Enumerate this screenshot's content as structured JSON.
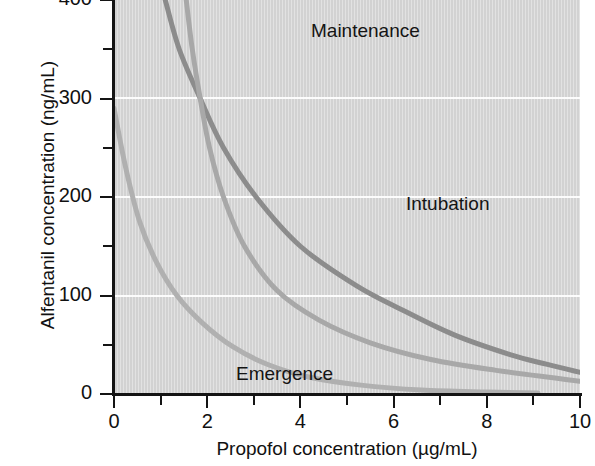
{
  "chart_data": {
    "type": "line",
    "title": "",
    "subtitle": "",
    "xlabel": "Propofol concentration (µg/mL)",
    "ylabel": "Alfentanil concentration (ng/mL)",
    "xlim": [
      0,
      10
    ],
    "ylim": [
      0,
      400
    ],
    "xticks": [
      0,
      1,
      2,
      3,
      4,
      5,
      6,
      7,
      8,
      9,
      10
    ],
    "xticklabels": [
      "0",
      "",
      "2",
      "",
      "4",
      "",
      "6",
      "",
      "8",
      "",
      "10"
    ],
    "yticks": [
      0,
      50,
      100,
      150,
      200,
      250,
      300,
      350,
      400
    ],
    "yticklabels": [
      "0",
      "",
      "100",
      "",
      "200",
      "",
      "300",
      "",
      "400"
    ],
    "grid": "horizontal-white-gridlines-at-100-200-300",
    "legend": "inline-curve-labels",
    "plot_background_color": "#d6d6d6",
    "series": [
      {
        "name": "Intubation",
        "label_position": {
          "x": 4.0,
          "y": 210
        },
        "color": "#8c8c8c",
        "linewidth": 5,
        "points": [
          {
            "x": 1.1,
            "y": 400
          },
          {
            "x": 1.4,
            "y": 350
          },
          {
            "x": 1.85,
            "y": 300
          },
          {
            "x": 2.35,
            "y": 250
          },
          {
            "x": 3.05,
            "y": 200
          },
          {
            "x": 4.0,
            "y": 150
          },
          {
            "x": 5.2,
            "y": 110
          },
          {
            "x": 6.2,
            "y": 85
          },
          {
            "x": 7.3,
            "y": 60
          },
          {
            "x": 8.5,
            "y": 40
          },
          {
            "x": 9.3,
            "y": 30
          },
          {
            "x": 10.0,
            "y": 22
          }
        ]
      },
      {
        "name": "Maintenance",
        "label_position": {
          "x": 1.8,
          "y": 375
        },
        "color": "#a8a8a8",
        "linewidth": 5,
        "points": [
          {
            "x": 1.55,
            "y": 400
          },
          {
            "x": 1.68,
            "y": 350
          },
          {
            "x": 1.85,
            "y": 300
          },
          {
            "x": 2.05,
            "y": 250
          },
          {
            "x": 2.35,
            "y": 200
          },
          {
            "x": 2.8,
            "y": 150
          },
          {
            "x": 3.5,
            "y": 105
          },
          {
            "x": 4.4,
            "y": 75
          },
          {
            "x": 5.5,
            "y": 52
          },
          {
            "x": 6.8,
            "y": 35
          },
          {
            "x": 8.2,
            "y": 24
          },
          {
            "x": 10.0,
            "y": 13
          }
        ]
      },
      {
        "name": "Emergence",
        "label_position": {
          "x": 0.2,
          "y": 35
        },
        "color": "#b0b0b0",
        "linewidth": 5,
        "points": [
          {
            "x": 0.0,
            "y": 290
          },
          {
            "x": 0.25,
            "y": 230
          },
          {
            "x": 0.55,
            "y": 175
          },
          {
            "x": 0.9,
            "y": 135
          },
          {
            "x": 1.35,
            "y": 100
          },
          {
            "x": 1.9,
            "y": 72
          },
          {
            "x": 2.55,
            "y": 48
          },
          {
            "x": 3.3,
            "y": 30
          },
          {
            "x": 4.2,
            "y": 17
          },
          {
            "x": 5.3,
            "y": 9
          },
          {
            "x": 6.6,
            "y": 4
          },
          {
            "x": 8.0,
            "y": 2
          },
          {
            "x": 9.1,
            "y": 1
          }
        ]
      }
    ]
  },
  "axes": {
    "y": {
      "title": "Alfentanil concentration (ng/mL)",
      "labels": [
        {
          "value": 400,
          "text": "400"
        },
        {
          "value": 300,
          "text": "300"
        },
        {
          "value": 200,
          "text": "200"
        },
        {
          "value": 100,
          "text": "100"
        },
        {
          "value": 0,
          "text": "0"
        }
      ]
    },
    "x": {
      "title": "Propofol concentration (µg/mL)",
      "labels": [
        {
          "value": 0,
          "text": "0"
        },
        {
          "value": 2,
          "text": "2"
        },
        {
          "value": 4,
          "text": "4"
        },
        {
          "value": 6,
          "text": "6"
        },
        {
          "value": 8,
          "text": "8"
        },
        {
          "value": 10,
          "text": "10"
        }
      ]
    }
  },
  "curve_labels": {
    "maintenance": "Maintenance",
    "intubation": "Intubation",
    "emergence": "Emergence"
  }
}
